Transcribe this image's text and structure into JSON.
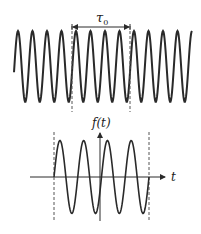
{
  "top_panel": {
    "interval_label": "τ",
    "interval_subscript": "0",
    "description": "Continuous sinusoid with a window of duration tau0 marked by dashed lines"
  },
  "bottom_panel": {
    "y_axis_label": "f(t)",
    "x_axis_label": "t",
    "description": "Truncated sinusoid (one window of length tau0) centered on the vertical axis"
  },
  "colors": {
    "line": "#2a2a2a",
    "dashed": "#555555",
    "background": "#ffffff"
  }
}
